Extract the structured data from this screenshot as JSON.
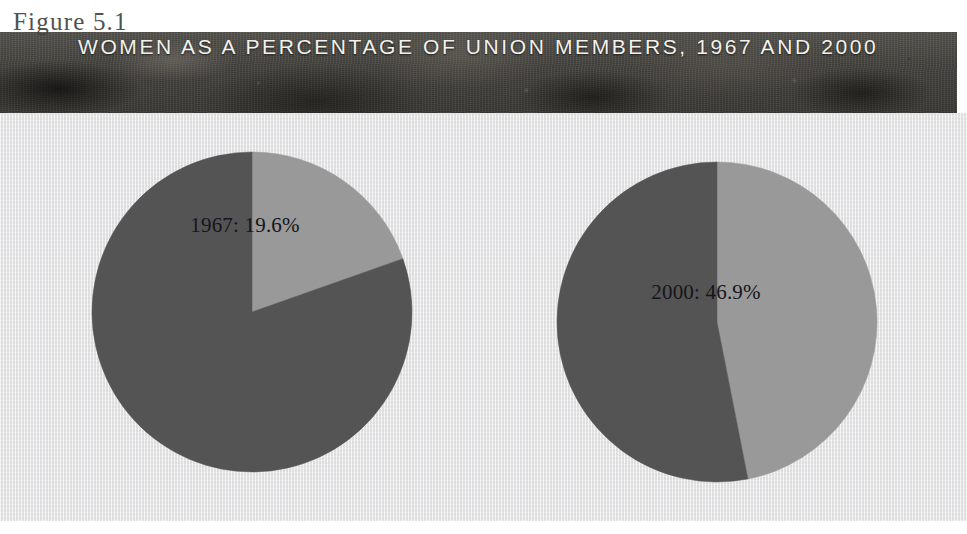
{
  "figure": {
    "caption": "Figure 5.1",
    "title": "WOMEN AS A PERCENTAGE OF UNION MEMBERS, 1967 AND 2000"
  },
  "colors": {
    "slice_women": "#999999",
    "slice_men": "#545454",
    "panel_background": "#ececed",
    "banner_background": "#46443f",
    "banner_text": "#f2f1ec",
    "label_text": "#16151a",
    "caption_text": "#43443f"
  },
  "charts": [
    {
      "name": "pie-1967",
      "label": "1967: 19.6%",
      "center_x": 252,
      "center_y": 312,
      "radius": 160,
      "label_x": 245,
      "label_y": 225
    },
    {
      "name": "pie-2000",
      "label": "2000: 46.9%",
      "center_x": 717,
      "center_y": 322,
      "radius": 160,
      "label_x": 706,
      "label_y": 292
    }
  ],
  "chart_data": {
    "type": "pie",
    "title": "WOMEN AS A PERCENTAGE OF UNION MEMBERS, 1967 AND 2000",
    "subtitle": "Figure 5.1",
    "xlabel": "",
    "ylabel": "",
    "legend": [],
    "grid": false,
    "charts": [
      {
        "name": "1967",
        "title": "1967: 19.6%",
        "labels": [
          "Women",
          "Other union members"
        ],
        "values": [
          19.6,
          80.4
        ],
        "colors": [
          "#999999",
          "#545454"
        ],
        "start_angle_deg": 0,
        "direction": "clockwise",
        "annotations": [
          "1967: 19.6%"
        ]
      },
      {
        "name": "2000",
        "title": "2000: 46.9%",
        "labels": [
          "Women",
          "Other union members"
        ],
        "values": [
          46.9,
          53.1
        ],
        "colors": [
          "#999999",
          "#545454"
        ],
        "start_angle_deg": 0,
        "direction": "clockwise",
        "annotations": [
          "2000: 46.9%"
        ]
      }
    ]
  }
}
